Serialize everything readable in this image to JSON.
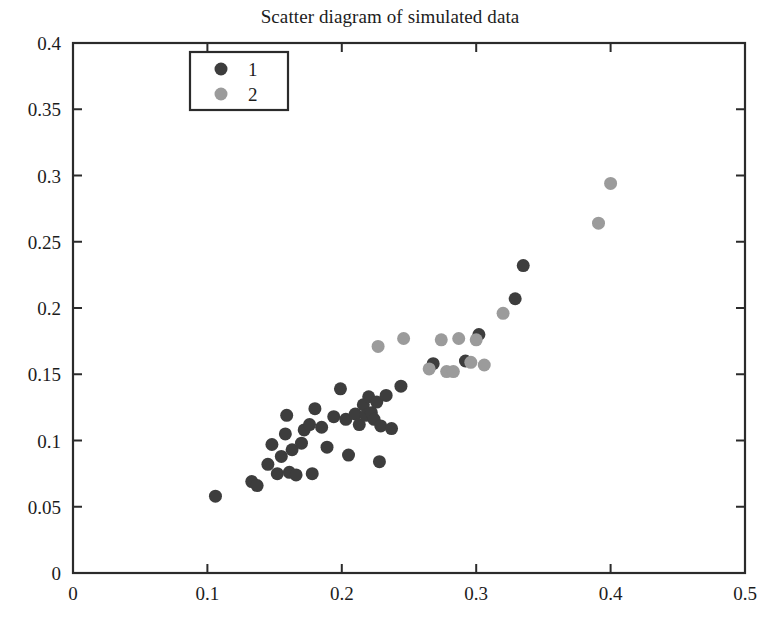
{
  "chart_data": {
    "type": "scatter",
    "title": "Scatter diagram of simulated data",
    "xlabel": "",
    "ylabel": "",
    "xlim": [
      0,
      0.5
    ],
    "ylim": [
      0,
      0.4
    ],
    "xticks": [
      0,
      0.1,
      0.2,
      0.3,
      0.4,
      0.5
    ],
    "xticklabels": [
      "0",
      "0.1",
      "0.2",
      "0.3",
      "0.4",
      "0.5"
    ],
    "yticks": [
      0,
      0.05,
      0.1,
      0.15,
      0.2,
      0.25,
      0.3,
      0.35,
      0.4
    ],
    "yticklabels": [
      "0",
      "0.05",
      "0.1",
      "0.15",
      "0.2",
      "0.25",
      "0.3",
      "0.35",
      "0.4"
    ],
    "grid": false,
    "legend_position": "upper left",
    "marker": "circle",
    "marker_size": 13,
    "series": [
      {
        "name": "1",
        "color": "#3d3d3d",
        "points": [
          [
            0.106,
            0.058
          ],
          [
            0.133,
            0.069
          ],
          [
            0.137,
            0.066
          ],
          [
            0.145,
            0.082
          ],
          [
            0.148,
            0.097
          ],
          [
            0.152,
            0.075
          ],
          [
            0.155,
            0.088
          ],
          [
            0.158,
            0.105
          ],
          [
            0.159,
            0.119
          ],
          [
            0.161,
            0.076
          ],
          [
            0.163,
            0.093
          ],
          [
            0.166,
            0.074
          ],
          [
            0.17,
            0.098
          ],
          [
            0.172,
            0.108
          ],
          [
            0.176,
            0.112
          ],
          [
            0.178,
            0.075
          ],
          [
            0.18,
            0.124
          ],
          [
            0.185,
            0.11
          ],
          [
            0.189,
            0.095
          ],
          [
            0.194,
            0.118
          ],
          [
            0.199,
            0.139
          ],
          [
            0.203,
            0.116
          ],
          [
            0.205,
            0.089
          ],
          [
            0.21,
            0.12
          ],
          [
            0.213,
            0.112
          ],
          [
            0.216,
            0.127
          ],
          [
            0.218,
            0.119
          ],
          [
            0.22,
            0.133
          ],
          [
            0.222,
            0.121
          ],
          [
            0.224,
            0.116
          ],
          [
            0.226,
            0.129
          ],
          [
            0.228,
            0.084
          ],
          [
            0.229,
            0.111
          ],
          [
            0.233,
            0.134
          ],
          [
            0.237,
            0.109
          ],
          [
            0.244,
            0.141
          ],
          [
            0.268,
            0.158
          ],
          [
            0.292,
            0.16
          ],
          [
            0.302,
            0.18
          ],
          [
            0.329,
            0.207
          ],
          [
            0.335,
            0.232
          ]
        ]
      },
      {
        "name": "2",
        "color": "#9b9b9b",
        "points": [
          [
            0.227,
            0.171
          ],
          [
            0.246,
            0.177
          ],
          [
            0.265,
            0.154
          ],
          [
            0.274,
            0.176
          ],
          [
            0.278,
            0.152
          ],
          [
            0.283,
            0.152
          ],
          [
            0.287,
            0.177
          ],
          [
            0.296,
            0.159
          ],
          [
            0.3,
            0.176
          ],
          [
            0.306,
            0.157
          ],
          [
            0.32,
            0.196
          ],
          [
            0.391,
            0.264
          ],
          [
            0.4,
            0.294
          ]
        ]
      }
    ]
  },
  "plot_frame": {
    "left_px": 73,
    "right_px": 745,
    "top_px": 43,
    "bottom_px": 573
  },
  "legend": {
    "entries": [
      {
        "label": "1",
        "color": "#3d3d3d"
      },
      {
        "label": "2",
        "color": "#9b9b9b"
      }
    ]
  }
}
